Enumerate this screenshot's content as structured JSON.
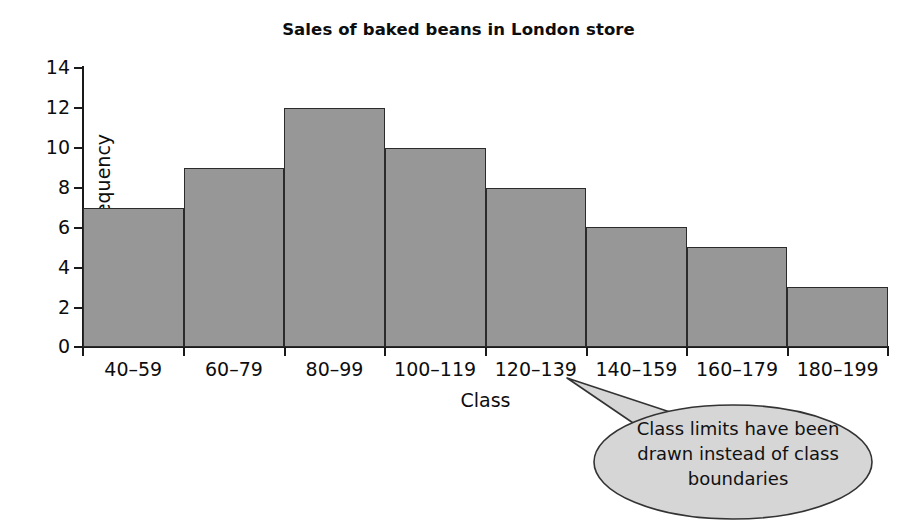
{
  "chart_data": {
    "type": "bar",
    "title": "Sales of baked beans in London store",
    "xlabel": "Class",
    "ylabel": "Frequency",
    "categories": [
      "40–59",
      "60–79",
      "80–99",
      "100–119",
      "120–139",
      "140–159",
      "160–179",
      "180–199"
    ],
    "values": [
      7,
      9,
      12,
      10,
      8,
      6,
      5,
      3
    ],
    "ylim": [
      0,
      14
    ],
    "ytick_labels": [
      "14",
      "12",
      "10",
      "8",
      "6",
      "4",
      "2",
      "0"
    ],
    "ytick_values": [
      14,
      12,
      10,
      8,
      6,
      4,
      2,
      0
    ],
    "ytick_step": 2,
    "grid": false,
    "legend": null,
    "bar_gap": 0,
    "bar_fill_color": "#979797",
    "bar_edge_color": "#2b2b2b",
    "axis_color": "#1a1a1a",
    "background_color": "#ffffff",
    "annotations": [
      {
        "text_line_1": "Class limits have been",
        "text_line_2": "drawn instead of class",
        "text_line_3": "boundaries",
        "shape": "ellipse-callout",
        "points_at_category": "120–139",
        "fill_color": "#d6d6d6",
        "edge_color": "#333333"
      }
    ]
  }
}
